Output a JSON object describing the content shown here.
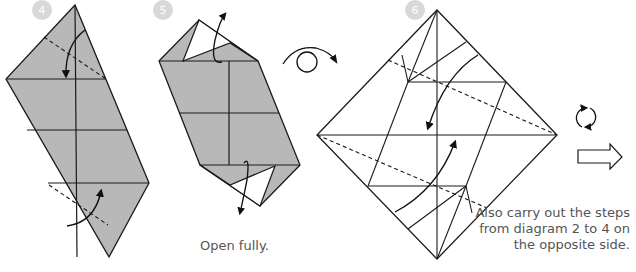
{
  "steps": [
    {
      "number": "4"
    },
    {
      "number": "5",
      "caption": "Open fully."
    },
    {
      "number": "6",
      "caption_lines": [
        "Also carry out the steps",
        "from diagram 2 to 4 on",
        "the opposite side."
      ]
    }
  ],
  "symbols": {
    "turn_over": "turn-over-icon",
    "rotate": "rotate-icon",
    "next": "next-arrow-icon"
  },
  "colors": {
    "paper_gray": "#b8b8b8",
    "badge": "#d8d8d8",
    "line": "#1a1a1a",
    "text": "#555555"
  }
}
